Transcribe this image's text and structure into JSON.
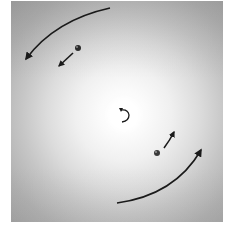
{
  "figure": {
    "background_colors": {
      "center": "#ffffff",
      "edge": "#a2a2a2",
      "margin": "#ffffff"
    },
    "arrow_color": "#1a1a1a",
    "ball_color": "#2a2a2a",
    "elements": {
      "center_rotation_icon": {
        "type": "counterclockwise-arrow",
        "x": 124,
        "y": 115
      },
      "ball_upper": {
        "x": 78,
        "y": 48,
        "r": 3
      },
      "ball_lower": {
        "x": 157,
        "y": 153,
        "r": 3
      },
      "arrow_upper_small": {
        "from": [
          73,
          53
        ],
        "to": [
          58,
          67
        ]
      },
      "arrow_lower_small": {
        "from": [
          164,
          148
        ],
        "to": [
          175,
          131
        ]
      },
      "arc_upper_large": {
        "from": [
          110,
          8
        ],
        "to": [
          25,
          61
        ]
      },
      "arc_lower_large": {
        "from": [
          117,
          203
        ],
        "to": [
          202,
          148
        ]
      }
    }
  }
}
